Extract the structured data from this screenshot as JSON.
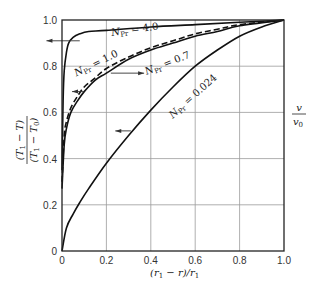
{
  "chart_data": {
    "type": "line",
    "title": "",
    "xlabel": "(r1 − r)/r1",
    "ylabel": "(T1 − T)/(T1 − T0)",
    "ylabel_right": "v/v0",
    "xlim": [
      0,
      1.0
    ],
    "ylim": [
      0,
      1.0
    ],
    "grid": true,
    "x_ticks": [
      "0",
      "0.2",
      "0.4",
      "0.6",
      "0.8",
      "1.0"
    ],
    "y_ticks": [
      "0",
      "0.2",
      "0.4",
      "0.6",
      "0.8",
      "1.0"
    ],
    "series": [
      {
        "name": "N_Pr = 4.0",
        "style": "solid",
        "x": [
          0.0,
          0.005,
          0.01,
          0.02,
          0.03,
          0.05,
          0.08,
          0.12,
          0.2,
          0.4,
          0.6,
          0.8,
          1.0
        ],
        "y": [
          0.35,
          0.65,
          0.78,
          0.86,
          0.9,
          0.925,
          0.94,
          0.95,
          0.955,
          0.97,
          0.98,
          0.99,
          1.0
        ]
      },
      {
        "name": "N_Pr = 1.0",
        "style": "dashed",
        "x": [
          0.0,
          0.01,
          0.02,
          0.04,
          0.07,
          0.1,
          0.15,
          0.2,
          0.3,
          0.4,
          0.5,
          0.6,
          0.7,
          0.8,
          1.0
        ],
        "y": [
          0.3,
          0.5,
          0.56,
          0.62,
          0.67,
          0.71,
          0.75,
          0.79,
          0.84,
          0.88,
          0.91,
          0.94,
          0.96,
          0.98,
          1.0
        ]
      },
      {
        "name": "N_Pr = 0.7",
        "style": "solid",
        "x": [
          0.0,
          0.01,
          0.02,
          0.04,
          0.07,
          0.1,
          0.15,
          0.2,
          0.3,
          0.4,
          0.5,
          0.6,
          0.7,
          0.8,
          1.0
        ],
        "y": [
          0.27,
          0.46,
          0.53,
          0.6,
          0.65,
          0.69,
          0.74,
          0.77,
          0.83,
          0.87,
          0.9,
          0.93,
          0.95,
          0.975,
          1.0
        ]
      },
      {
        "name": "N_Pr = 0.024",
        "style": "solid",
        "x": [
          0.0,
          0.02,
          0.05,
          0.08,
          0.12,
          0.2,
          0.3,
          0.4,
          0.5,
          0.6,
          0.7,
          0.8,
          0.9,
          1.0
        ],
        "y": [
          0.0,
          0.1,
          0.16,
          0.21,
          0.27,
          0.38,
          0.5,
          0.61,
          0.71,
          0.8,
          0.87,
          0.93,
          0.97,
          1.0
        ]
      }
    ],
    "annotations": [
      {
        "text": "N_Pr = 4.0",
        "x": 0.33,
        "y": 0.945,
        "angle": -8
      },
      {
        "text": "N_Pr = 1.0",
        "x": 0.16,
        "y": 0.8,
        "angle": -26
      },
      {
        "text": "N_Pr = 0.7",
        "x": 0.48,
        "y": 0.8,
        "angle": -22
      },
      {
        "text": "N_Pr = 0.024",
        "x": 0.6,
        "y": 0.66,
        "angle": -42
      }
    ],
    "arrows": [
      {
        "direction": "left",
        "y": 0.91,
        "x_from": 0.08,
        "x_to": -0.07
      },
      {
        "direction": "right",
        "y": 0.77,
        "x_from": 0.22,
        "x_to": 0.37
      },
      {
        "direction": "left",
        "y": 0.69,
        "x_from": 0.1,
        "x_to": 0.045
      },
      {
        "direction": "left",
        "y": 0.52,
        "x_from": 0.31,
        "x_to": 0.24
      }
    ]
  },
  "labels": {
    "y_num": "(T",
    "y_den": "(T",
    "right_num": "v",
    "right_den": "v"
  }
}
